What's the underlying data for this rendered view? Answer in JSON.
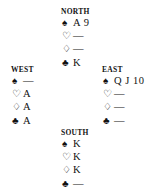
{
  "diagram": {
    "type": "bridge-hand-diagram",
    "background_color": "#ffffff",
    "text_color": "#111111",
    "void_marker": "—",
    "suit_symbols": {
      "spade": "♠",
      "heart": "♡",
      "diamond": "♢",
      "club": "♣"
    },
    "suit_names": {
      "spade": "spade-suit-symbol",
      "heart": "heart-suit-symbol",
      "diamond": "diamond-suit-symbol",
      "club": "club-suit-symbol"
    }
  },
  "hands": {
    "north": {
      "label": "NORTH",
      "spades": "A 9",
      "hearts": "—",
      "diamonds": "—",
      "clubs": "K"
    },
    "west": {
      "label": "WEST",
      "spades": "—",
      "hearts": "A",
      "diamonds": "A",
      "clubs": "A"
    },
    "east": {
      "label": "EAST",
      "spades": "Q J 10",
      "hearts": "—",
      "diamonds": "—",
      "clubs": "—"
    },
    "south": {
      "label": "SOUTH",
      "spades": "K",
      "hearts": "K",
      "diamonds": "K",
      "clubs": "—"
    }
  }
}
